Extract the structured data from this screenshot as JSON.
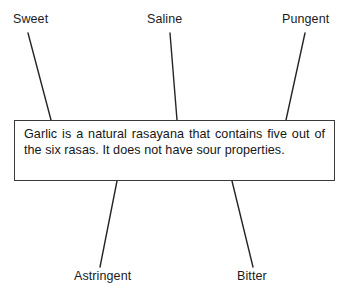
{
  "figure": {
    "background_color": "#ffffff",
    "line_color": "#252525",
    "text_color": "#1a1a1a",
    "border_color": "#3a3a3a",
    "width": 356,
    "height": 302
  },
  "statement": {
    "text": "Garlic is a natural rasayana that contains five out of the six rasas. It does not have sour properties."
  },
  "callouts": {
    "top": [
      {
        "id": "sweet",
        "label": "Sweet",
        "line": {
          "x1": 28,
          "y1": 33,
          "x2": 51,
          "y2": 120
        }
      },
      {
        "id": "saline",
        "label": "Saline",
        "line": {
          "x1": 170,
          "y1": 33,
          "x2": 177,
          "y2": 120
        }
      },
      {
        "id": "pungent",
        "label": "Pungent",
        "line": {
          "x1": 305,
          "y1": 33,
          "x2": 286,
          "y2": 120
        }
      }
    ],
    "bottom": [
      {
        "id": "astringent",
        "label": "Astringent",
        "line": {
          "x1": 117,
          "y1": 181,
          "x2": 100,
          "y2": 267
        }
      },
      {
        "id": "bitter",
        "label": "Bitter",
        "line": {
          "x1": 232,
          "y1": 181,
          "x2": 253,
          "y2": 267
        }
      }
    ]
  }
}
